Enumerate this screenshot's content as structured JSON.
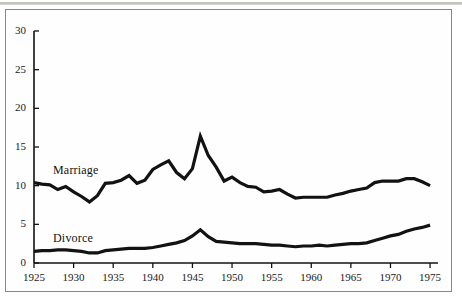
{
  "figure": {
    "name": "marriage-and-divorce-rate-line-chart",
    "background_color": "#ffffff",
    "frame_color": "#8a8884",
    "ink_color": "#121212"
  },
  "chart_data": {
    "type": "line",
    "title": "",
    "subtitle": "",
    "xlabel": "",
    "ylabel": "",
    "xlim": [
      1925,
      1976
    ],
    "ylim": [
      0,
      30
    ],
    "xticks": [
      1925,
      1930,
      1935,
      1940,
      1945,
      1950,
      1955,
      1960,
      1965,
      1970,
      1975
    ],
    "xtick_labels": [
      "1925",
      "1930",
      "1935",
      "1940",
      "1945",
      "1950",
      "1955",
      "1960",
      "1965",
      "1970",
      "1975"
    ],
    "yticks": [
      0,
      5,
      10,
      15,
      20,
      25,
      30
    ],
    "ytick_labels": [
      "0",
      "5",
      "10",
      "15",
      "20",
      "25",
      "30"
    ],
    "grid": false,
    "legend_position": "inline-annotations",
    "x": [
      1925,
      1926,
      1927,
      1928,
      1929,
      1930,
      1931,
      1932,
      1933,
      1934,
      1935,
      1936,
      1937,
      1938,
      1939,
      1940,
      1941,
      1942,
      1943,
      1944,
      1945,
      1946,
      1947,
      1948,
      1949,
      1950,
      1951,
      1952,
      1953,
      1954,
      1955,
      1956,
      1957,
      1958,
      1959,
      1960,
      1961,
      1962,
      1963,
      1964,
      1965,
      1966,
      1967,
      1968,
      1969,
      1970,
      1971,
      1972,
      1973,
      1974,
      1975
    ],
    "series": [
      {
        "name": "Marriage",
        "label": "Marriage",
        "color": "#121212",
        "line_width": 3.2,
        "label_position": {
          "x": 1927.4,
          "y": 11.9
        },
        "values": [
          10.4,
          10.2,
          10.1,
          9.5,
          9.9,
          9.2,
          8.6,
          7.9,
          8.7,
          10.3,
          10.4,
          10.7,
          11.3,
          10.3,
          10.7,
          12.1,
          12.7,
          13.2,
          11.7,
          10.9,
          12.2,
          16.4,
          13.9,
          12.4,
          10.6,
          11.1,
          10.4,
          9.9,
          9.8,
          9.2,
          9.3,
          9.5,
          8.9,
          8.4,
          8.5,
          8.5,
          8.5,
          8.5,
          8.8,
          9.0,
          9.3,
          9.5,
          9.7,
          10.4,
          10.6,
          10.6,
          10.6,
          10.9,
          10.9,
          10.5,
          10.0
        ]
      },
      {
        "name": "Divorce",
        "label": "Divorce",
        "color": "#121212",
        "line_width": 3.2,
        "label_position": {
          "x": 1927.4,
          "y": 3.1
        },
        "values": [
          1.5,
          1.6,
          1.6,
          1.7,
          1.7,
          1.6,
          1.5,
          1.3,
          1.3,
          1.6,
          1.7,
          1.8,
          1.9,
          1.9,
          1.9,
          2.0,
          2.2,
          2.4,
          2.6,
          2.9,
          3.5,
          4.3,
          3.4,
          2.8,
          2.7,
          2.6,
          2.5,
          2.5,
          2.5,
          2.4,
          2.3,
          2.3,
          2.2,
          2.1,
          2.2,
          2.2,
          2.3,
          2.2,
          2.3,
          2.4,
          2.5,
          2.5,
          2.6,
          2.9,
          3.2,
          3.5,
          3.7,
          4.1,
          4.4,
          4.6,
          4.9
        ]
      }
    ]
  },
  "axes": {
    "y_axis_name": "y-axis",
    "x_axis_name": "x-axis"
  }
}
